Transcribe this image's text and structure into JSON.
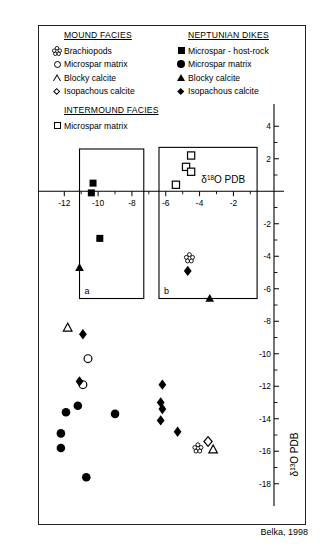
{
  "legend": {
    "mound": {
      "title": "MOUND FACIES",
      "items": [
        {
          "symbol": "brachiopod-shell-icon",
          "label": "Brachiopods"
        },
        {
          "symbol": "open-circle-icon",
          "label": "Microspar matrix"
        },
        {
          "symbol": "open-triangle-icon",
          "label": "Blocky calcite"
        },
        {
          "symbol": "open-diamond-icon",
          "label": "Isopachous calcite"
        }
      ]
    },
    "intermound": {
      "title": "INTERMOUND FACIES",
      "items": [
        {
          "symbol": "open-square-icon",
          "label": "Microspar matrix"
        }
      ]
    },
    "dikes": {
      "title": "NEPTUNIAN DIKES",
      "items": [
        {
          "symbol": "filled-square-icon",
          "label": "Microspar - host-rock"
        },
        {
          "symbol": "filled-circle-icon",
          "label": "Microspar matrix"
        },
        {
          "symbol": "filled-triangle-icon",
          "label": "Blocky calcite"
        },
        {
          "symbol": "filled-diamond-icon",
          "label": "Isopachous calcite"
        }
      ]
    }
  },
  "credit": "Belka, 1998",
  "boxes": [
    {
      "label": "a",
      "x0": -11.1,
      "x1": -7.3,
      "y0": -6.6,
      "y1": 2.6
    },
    {
      "label": "b",
      "x0": -6.4,
      "x1": -0.6,
      "y0": -6.6,
      "y1": 2.7
    }
  ],
  "chart_data": {
    "type": "scatter",
    "title": "",
    "xlabel": "δ¹⁸O PDB",
    "ylabel": "δ¹³O PDB",
    "xlim": [
      -13.2,
      0.4
    ],
    "ylim": [
      -19,
      5
    ],
    "x_ticks": [
      -12,
      -10,
      -8,
      -6,
      -4,
      -2
    ],
    "x_tick_labels": [
      "-12",
      "-10",
      "-8",
      "-6",
      "-4",
      "-2"
    ],
    "x_minor_ticks": [
      -11,
      -9,
      -7,
      -5,
      -3,
      -1
    ],
    "y_ticks": [
      4,
      2,
      -2,
      -4,
      -6,
      -8,
      -10,
      -12,
      -14,
      -16,
      -18
    ],
    "y_tick_labels": [
      "4",
      "2",
      "-2",
      "-4",
      "-6",
      "-8",
      "-10",
      "-12",
      "-14",
      "-16",
      "-18"
    ],
    "y_minor_ticks": [
      3,
      1,
      -1,
      -3,
      -5,
      -7,
      -9,
      -11,
      -13,
      -15,
      -17
    ],
    "grid": false,
    "legend_position": "top",
    "series": [
      {
        "name": "Brachiopods",
        "symbol": "open-brachiopod",
        "points": [
          [
            -4.6,
            -4.1
          ],
          [
            -4.1,
            -15.8
          ]
        ]
      },
      {
        "name": "Microspar matrix (mound)",
        "symbol": "open-circle",
        "points": [
          [
            -10.6,
            -10.3
          ],
          [
            -10.9,
            -11.9
          ]
        ]
      },
      {
        "name": "Blocky calcite (mound)",
        "symbol": "open-triangle",
        "points": [
          [
            -11.8,
            -8.4
          ],
          [
            -3.2,
            -15.9
          ]
        ]
      },
      {
        "name": "Isopachous calcite (mound)",
        "symbol": "open-diamond",
        "points": [
          [
            -3.5,
            -15.4
          ]
        ]
      },
      {
        "name": "Microspar matrix (intermound)",
        "symbol": "open-square",
        "points": [
          [
            -4.5,
            2.2
          ],
          [
            -4.8,
            1.5
          ],
          [
            -4.5,
            1.2
          ],
          [
            -5.4,
            0.4
          ]
        ]
      },
      {
        "name": "Microspar - host-rock (dikes)",
        "symbol": "filled-square",
        "points": [
          [
            -10.3,
            0.5
          ],
          [
            -10.4,
            -0.1
          ],
          [
            -9.9,
            -2.9
          ]
        ]
      },
      {
        "name": "Microspar matrix (dikes)",
        "symbol": "filled-circle",
        "points": [
          [
            -11.2,
            -13.2
          ],
          [
            -11.9,
            -13.6
          ],
          [
            -12.2,
            -14.9
          ],
          [
            -12.2,
            -15.8
          ],
          [
            -10.7,
            -17.6
          ],
          [
            -9.0,
            -13.7
          ]
        ]
      },
      {
        "name": "Blocky calcite (dikes)",
        "symbol": "filled-triangle",
        "points": [
          [
            -11.1,
            -4.7
          ],
          [
            -3.4,
            -6.6
          ]
        ]
      },
      {
        "name": "Isopachous calcite (dikes)",
        "symbol": "filled-diamond",
        "points": [
          [
            -4.7,
            -4.9
          ],
          [
            -10.9,
            -8.8
          ],
          [
            -11.1,
            -11.7
          ],
          [
            -6.2,
            -11.9
          ],
          [
            -6.2,
            -13.4
          ],
          [
            -6.3,
            -13.0
          ],
          [
            -6.3,
            -14.1
          ],
          [
            -5.3,
            -14.8
          ]
        ]
      }
    ]
  }
}
